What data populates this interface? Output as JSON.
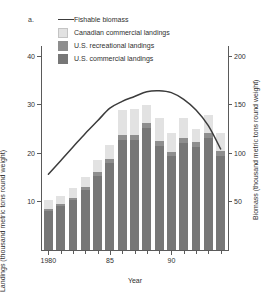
{
  "panel": {
    "label": "a."
  },
  "legend": {
    "items": [
      {
        "type": "line",
        "label": "Fishable biomass",
        "color": "#3c3c3c"
      },
      {
        "type": "swatch",
        "label": "Canadian commercial landings",
        "color": "#e2e2e2"
      },
      {
        "type": "swatch",
        "label": "U.S. recreational landings",
        "color": "#8e8e8e"
      },
      {
        "type": "swatch",
        "label": "U.S. commercial landings",
        "color": "#777777"
      }
    ]
  },
  "chart_data": {
    "type": "bar",
    "title": "",
    "xlabel": "Year",
    "ylabel": "Landings (thousand metric tons round weight)",
    "y2label": "Biomass (thousand metric tons round weight)",
    "ylim": [
      0,
      42
    ],
    "y2lim": [
      0,
      210
    ],
    "yticks": [
      10,
      20,
      30,
      40
    ],
    "y2ticks": [
      50,
      100,
      150,
      200
    ],
    "xlim": [
      1979.4,
      1994.6
    ],
    "xticks": [
      1980,
      1981,
      1982,
      1983,
      1984,
      1985,
      1986,
      1987,
      1988,
      1989,
      1990,
      1991,
      1992,
      1993,
      1994
    ],
    "xticklabels": {
      "1980": "1980",
      "1985": "85",
      "1990": "90"
    },
    "grid": false,
    "legend_position": "top-left",
    "stacked": true,
    "categories": [
      1980,
      1981,
      1982,
      1983,
      1984,
      1985,
      1986,
      1987,
      1988,
      1989,
      1990,
      1991,
      1992,
      1993,
      1994
    ],
    "series": [
      {
        "name": "U.S. commercial landings",
        "color": "#777777",
        "values": [
          8.0,
          9.0,
          10.3,
          12.3,
          15.3,
          17.9,
          22.6,
          22.6,
          25.1,
          21.5,
          19.3,
          22.0,
          21.2,
          23.0,
          19.4
        ]
      },
      {
        "name": "U.S. recreational landings",
        "color": "#8e8e8e",
        "values": [
          0.4,
          0.4,
          0.5,
          0.6,
          0.7,
          0.8,
          1.0,
          1.0,
          1.1,
          0.9,
          0.9,
          1.0,
          1.0,
          1.0,
          0.9
        ]
      },
      {
        "name": "Canadian commercial landings",
        "color": "#e2e2e2",
        "values": [
          1.8,
          1.7,
          1.9,
          2.2,
          2.6,
          3.0,
          5.3,
          5.5,
          3.6,
          4.8,
          3.9,
          4.2,
          2.7,
          3.7,
          3.8
        ]
      }
    ],
    "line_series": {
      "name": "Fishable biomass",
      "color": "#3c3c3c",
      "axis": "right",
      "x": [
        1980,
        1981,
        1982,
        1983,
        1984,
        1985,
        1986,
        1987,
        1988,
        1989,
        1990,
        1991,
        1992,
        1993,
        1994
      ],
      "values": [
        78,
        92,
        106,
        120,
        133,
        146,
        153,
        158,
        163,
        164,
        162,
        155,
        144,
        128,
        104
      ]
    }
  }
}
